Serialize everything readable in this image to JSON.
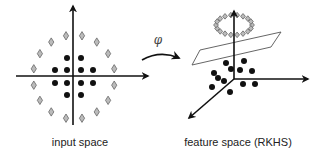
{
  "diagram": {
    "colors": {
      "axis": "#111111",
      "dot": "#111111",
      "diamond_fill": "#bbbbbb",
      "diamond_stroke": "#666666",
      "plane_stroke": "#555555"
    },
    "input_space": {
      "label": "input space",
      "inner_points": [
        [
          67,
          58
        ],
        [
          81,
          58
        ],
        [
          55,
          70
        ],
        [
          67,
          70
        ],
        [
          81,
          70
        ],
        [
          93,
          70
        ],
        [
          55,
          83
        ],
        [
          67,
          83
        ],
        [
          81,
          83
        ],
        [
          93,
          83
        ],
        [
          67,
          95
        ],
        [
          81,
          95
        ]
      ],
      "outer_ring": {
        "cx": 74,
        "cy": 77,
        "rx": 41,
        "ry": 42,
        "count": 16
      }
    },
    "mapping": {
      "symbol": "φ"
    },
    "feature_space": {
      "label": "feature space (RKHS)",
      "origin": [
        234,
        79
      ],
      "inner_points": [
        [
          226,
          63
        ],
        [
          244,
          61
        ],
        [
          214,
          73
        ],
        [
          231,
          69
        ],
        [
          240,
          70
        ],
        [
          252,
          71
        ],
        [
          212,
          87
        ],
        [
          224,
          81
        ],
        [
          243,
          84
        ],
        [
          255,
          84
        ],
        [
          230,
          92
        ],
        [
          218,
          78
        ]
      ],
      "outer_ring": {
        "cx": 234,
        "cy": 25,
        "rx": 18,
        "ry": 10,
        "count": 18
      },
      "separating_plane": [
        [
          192,
          65
        ],
        [
          200,
          50
        ],
        [
          281,
          32
        ],
        [
          271,
          47
        ]
      ]
    }
  }
}
